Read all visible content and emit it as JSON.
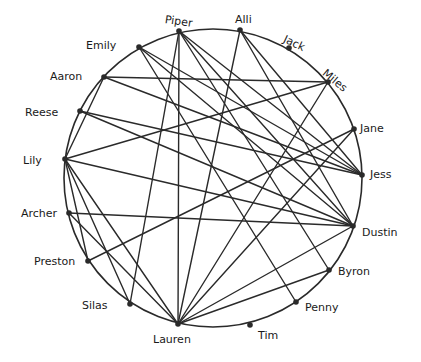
{
  "diagram": {
    "type": "circular-network-graph",
    "style": "hand-drawn",
    "ink_color": "#2a2a2a",
    "background": "#ffffff",
    "circle": {
      "cx": 213,
      "cy": 178,
      "r": 149
    },
    "nodes": [
      {
        "id": "piper",
        "label": "Piper",
        "x": 179,
        "y": 31,
        "label_x": 165,
        "label_y": 14,
        "rotate": 8
      },
      {
        "id": "alli",
        "label": "Alli",
        "x": 240,
        "y": 30,
        "label_x": 235,
        "label_y": 14,
        "rotate": 0
      },
      {
        "id": "jack",
        "label": "Jack",
        "x": 289,
        "y": 48,
        "label_x": 284,
        "label_y": 33,
        "rotate": 25
      },
      {
        "id": "miles",
        "label": "Miles",
        "x": 328,
        "y": 82,
        "label_x": 324,
        "label_y": 66,
        "rotate": 40
      },
      {
        "id": "jane",
        "label": "Jane",
        "x": 354,
        "y": 129,
        "label_x": 360,
        "label_y": 123,
        "rotate": 0
      },
      {
        "id": "jess",
        "label": "Jess",
        "x": 362,
        "y": 175,
        "label_x": 370,
        "label_y": 169,
        "rotate": 0
      },
      {
        "id": "dustin",
        "label": "Dustin",
        "x": 353,
        "y": 226,
        "label_x": 362,
        "label_y": 227,
        "rotate": 0
      },
      {
        "id": "byron",
        "label": "Byron",
        "x": 329,
        "y": 270,
        "label_x": 338,
        "label_y": 266,
        "rotate": 0
      },
      {
        "id": "penny",
        "label": "Penny",
        "x": 296,
        "y": 302,
        "label_x": 305,
        "label_y": 302,
        "rotate": 0
      },
      {
        "id": "tim",
        "label": "Tim",
        "x": 250,
        "y": 325,
        "label_x": 258,
        "label_y": 330,
        "rotate": 0
      },
      {
        "id": "lauren",
        "label": "Lauren",
        "x": 178,
        "y": 324,
        "label_x": 153,
        "label_y": 334,
        "rotate": 0
      },
      {
        "id": "silas",
        "label": "Silas",
        "x": 130,
        "y": 304,
        "label_x": 82,
        "label_y": 300,
        "rotate": 0
      },
      {
        "id": "preston",
        "label": "Preston",
        "x": 88,
        "y": 261,
        "label_x": 34,
        "label_y": 256,
        "rotate": 0
      },
      {
        "id": "archer",
        "label": "Archer",
        "x": 69,
        "y": 213,
        "label_x": 21,
        "label_y": 208,
        "rotate": 0
      },
      {
        "id": "lily",
        "label": "Lily",
        "x": 65,
        "y": 159,
        "label_x": 23,
        "label_y": 155,
        "rotate": 0
      },
      {
        "id": "reese",
        "label": "Reese",
        "x": 80,
        "y": 111,
        "label_x": 25,
        "label_y": 107,
        "rotate": 0
      },
      {
        "id": "aaron",
        "label": "Aaron",
        "x": 104,
        "y": 77,
        "label_x": 50,
        "label_y": 71,
        "rotate": 0
      },
      {
        "id": "emily",
        "label": "Emily",
        "x": 139,
        "y": 47,
        "label_x": 86,
        "label_y": 40,
        "rotate": 0
      }
    ],
    "edges": [
      [
        "emily",
        "jess"
      ],
      [
        "emily",
        "dustin"
      ],
      [
        "emily",
        "penny"
      ],
      [
        "piper",
        "lauren"
      ],
      [
        "piper",
        "jess"
      ],
      [
        "piper",
        "dustin"
      ],
      [
        "piper",
        "byron"
      ],
      [
        "alli",
        "lauren"
      ],
      [
        "alli",
        "dustin"
      ],
      [
        "alli",
        "jess"
      ],
      [
        "miles",
        "aaron"
      ],
      [
        "miles",
        "lily"
      ],
      [
        "miles",
        "lauren"
      ],
      [
        "jane",
        "preston"
      ],
      [
        "jane",
        "lauren"
      ],
      [
        "aaron",
        "jess"
      ],
      [
        "aaron",
        "lily"
      ],
      [
        "reese",
        "dustin"
      ],
      [
        "reese",
        "jess"
      ],
      [
        "lily",
        "dustin"
      ],
      [
        "lily",
        "silas"
      ],
      [
        "lily",
        "lauren"
      ],
      [
        "lily",
        "preston"
      ],
      [
        "archer",
        "dustin"
      ],
      [
        "archer",
        "lauren"
      ],
      [
        "silas",
        "piper"
      ],
      [
        "lauren",
        "byron"
      ],
      [
        "lauren",
        "dustin"
      ]
    ]
  }
}
